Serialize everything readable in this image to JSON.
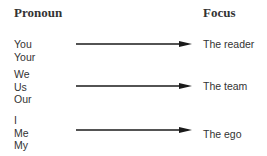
{
  "headers": {
    "left": "Pronoun",
    "right": "Focus"
  },
  "rows": [
    {
      "pronouns": [
        "You",
        "Your"
      ],
      "focus": "The reader"
    },
    {
      "pronouns": [
        "We",
        "Us",
        "Our"
      ],
      "focus": "The team"
    },
    {
      "pronouns": [
        "I",
        "Me",
        "My"
      ],
      "focus": "The ego"
    }
  ],
  "colors": {
    "text": "#333333",
    "arrow": "#1a1a1a"
  }
}
